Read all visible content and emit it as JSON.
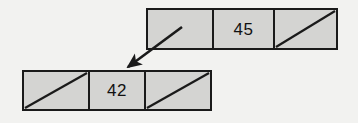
{
  "diagram": {
    "type": "linked-list-nodes",
    "background_color": "#f2f2f0",
    "cell_fill_color": "#d4d4d2",
    "stroke_color": "#1a1a1a",
    "nodes": [
      {
        "id": "node-top",
        "position": "upper-right",
        "cells": [
          {
            "kind": "pointer",
            "label": "",
            "marker": "outgoing-arrow"
          },
          {
            "kind": "value",
            "label": "45",
            "marker": "none"
          },
          {
            "kind": "null-pointer",
            "label": "",
            "marker": "diagonal-slash"
          }
        ]
      },
      {
        "id": "node-bottom",
        "position": "lower-left",
        "cells": [
          {
            "kind": "null-pointer",
            "label": "",
            "marker": "diagonal-slash"
          },
          {
            "kind": "value",
            "label": "42",
            "marker": "none"
          },
          {
            "kind": "null-pointer",
            "label": "",
            "marker": "diagonal-slash"
          }
        ]
      }
    ],
    "arrow": {
      "name": "pointer-arrow",
      "from_node": "node-top",
      "from_cell_index": 0,
      "to_node": "node-bottom",
      "direction": "down-left",
      "start_x": 182,
      "start_y": 27,
      "end_x": 124,
      "end_y": 70
    }
  }
}
